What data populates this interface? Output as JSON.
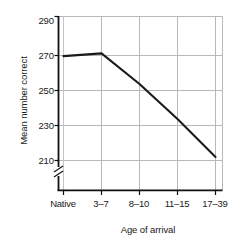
{
  "chart_data": {
    "type": "line",
    "title": "",
    "xlabel": "Age of arrival",
    "ylabel": "Mean number correct",
    "categories": [
      "Native",
      "3–7",
      "8–10",
      "11–15",
      "17–39"
    ],
    "values": [
      268,
      269.5,
      252.5,
      233,
      212
    ],
    "series": [
      {
        "name": "Mean number correct",
        "values": [
          268,
          269.5,
          252.5,
          233,
          212
        ]
      }
    ],
    "ylim": [
      205,
      290
    ],
    "yticks": [
      210,
      230,
      250,
      270,
      290
    ],
    "ytick_labels": [
      "210",
      "230",
      "250",
      "270",
      "290"
    ],
    "xtick_labels": [
      "Native",
      "3–7",
      "8–10",
      "11–15",
      "17–39"
    ],
    "grid": true,
    "grid_color": "#b8b8b8",
    "axis_color": "#111111",
    "line_color": "#1a1a1a",
    "axis_break": true,
    "axis_break_note": "y-axis break below 210",
    "legend": null,
    "legend_position": "none"
  },
  "labels": {
    "y_axis_title": "Mean number correct",
    "x_axis_title": "Age of arrival",
    "y_tick_210": "210",
    "y_tick_230": "230",
    "y_tick_250": "250",
    "y_tick_270": "270",
    "y_tick_290": "290",
    "x_tick_0": "Native",
    "x_tick_1": "3–7",
    "x_tick_2": "8–10",
    "x_tick_3": "11–15",
    "x_tick_4": "17–39"
  }
}
